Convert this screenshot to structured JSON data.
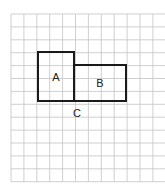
{
  "diagram": {
    "grid": {
      "x0": 11,
      "y0": 14,
      "cols": 12,
      "rows": 13,
      "cell": 12.9,
      "color": "#c4c4c4"
    },
    "shapes": [
      {
        "id": "A",
        "label": "A",
        "x": 38,
        "y": 52,
        "w": 36,
        "h": 49
      },
      {
        "id": "B",
        "label": "B",
        "x": 74,
        "y": 65,
        "w": 52,
        "h": 36
      }
    ],
    "point_label": {
      "label": "C",
      "x": 77,
      "y": 117
    }
  }
}
